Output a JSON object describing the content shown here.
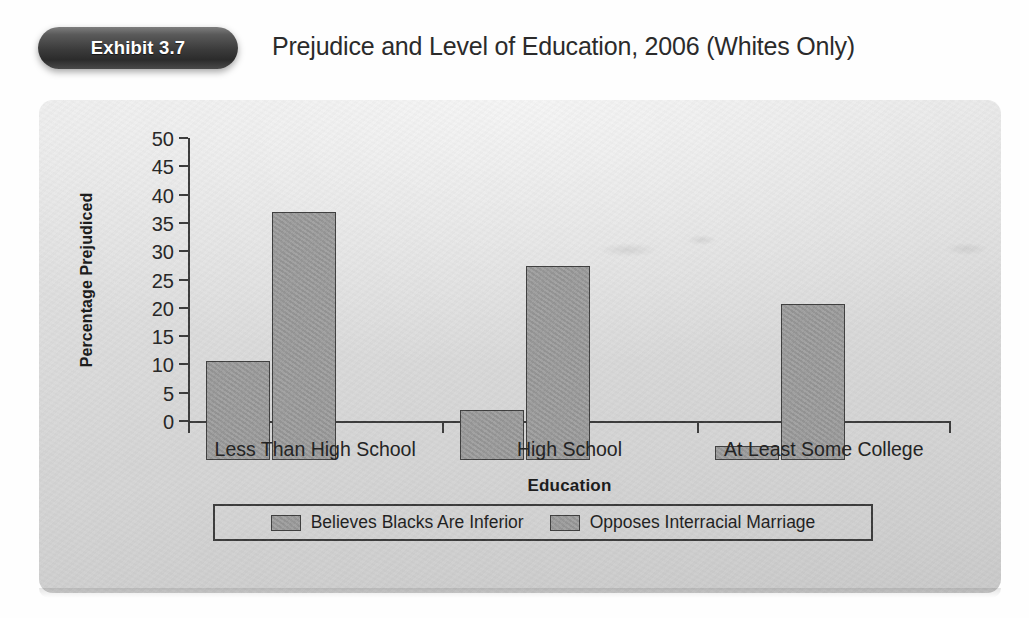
{
  "header": {
    "badge_label": "Exhibit 3.7",
    "title": "Prejudice and Level of Education, 2006 (Whites Only)"
  },
  "colors": {
    "badge_dark": "#2b2b2b",
    "panel_gray": "#dcdcdc",
    "bar_fill": "#9d9d9d",
    "bar_stroke": "#3f3f3f",
    "axis": "#3c3c3c",
    "text": "#232323"
  },
  "chart_data": {
    "type": "bar",
    "title": "Prejudice and Level of Education, 2006 (Whites Only)",
    "xlabel": "Education",
    "ylabel": "Percentage Prejudiced",
    "categories": [
      "Less Than High School",
      "High School",
      "At Least Some College"
    ],
    "series": [
      {
        "name": "Believes Blacks Are Inferior",
        "values": [
          17.5,
          8.9,
          2.4
        ]
      },
      {
        "name": "Opposes Interracial Marriage",
        "values": [
          43.8,
          34.2,
          27.5
        ]
      }
    ],
    "ylim": [
      0,
      50
    ],
    "ytick_labels": [
      "50",
      "45",
      "40",
      "35",
      "30",
      "25",
      "20",
      "15",
      "10",
      "5",
      "0"
    ],
    "ytick_values": [
      50,
      45,
      40,
      35,
      30,
      25,
      20,
      15,
      10,
      5,
      0
    ],
    "ystep": 5,
    "grid": false,
    "legend_position": "bottom"
  },
  "legend": {
    "items": [
      {
        "label": "Believes Blacks Are Inferior"
      },
      {
        "label": "Opposes Interracial Marriage"
      }
    ]
  }
}
